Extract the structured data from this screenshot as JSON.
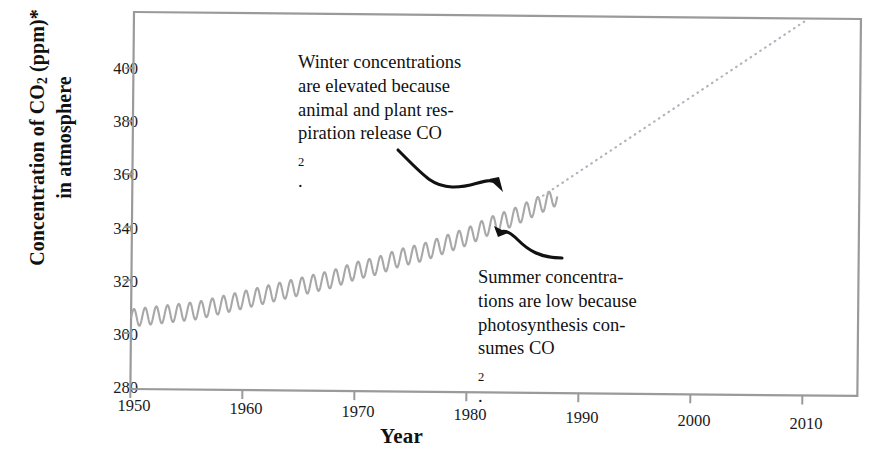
{
  "chart_data": {
    "type": "line",
    "title": "",
    "xlabel": "Year",
    "ylabel_line1": "Concentration of CO2 (ppm)*",
    "ylabel_line2": "in atmosphere",
    "ylabel_main": "Concentration of CO",
    "ylabel_sub": "2",
    "ylabel_tail": " (ppm)*",
    "xlim": [
      1950,
      2015
    ],
    "ylim": [
      280,
      418
    ],
    "grid": false,
    "legend": "none",
    "xticks": [
      "1950",
      "1960",
      "1970",
      "1980",
      "1990",
      "2000",
      "2010"
    ],
    "xtick_values": [
      1950,
      1960,
      1970,
      1980,
      1990,
      2000,
      2010
    ],
    "yticks": [
      "280",
      "300",
      "320",
      "340",
      "360",
      "380",
      "400"
    ],
    "ytick_values": [
      280,
      300,
      320,
      340,
      360,
      380,
      400
    ],
    "series": [
      {
        "name": "Observed CO2 (Keeling curve, seasonal oscillation)",
        "style": "solid-oscillating",
        "color": "#a8a8a8",
        "x_start": 1950,
        "x_end": 1988,
        "annual_cycle_amplitude_ppm": 3.2,
        "x": [
          1950,
          1952,
          1954,
          1956,
          1958,
          1960,
          1962,
          1964,
          1966,
          1968,
          1970,
          1972,
          1974,
          1976,
          1978,
          1980,
          1982,
          1984,
          1986,
          1988
        ],
        "values": [
          306,
          307,
          308,
          309,
          311,
          313,
          315,
          317,
          319,
          321,
          324,
          326,
          329,
          331,
          334,
          337,
          341,
          344,
          348,
          352
        ]
      },
      {
        "name": "Projected CO2",
        "style": "dotted-projection",
        "color": "#b4b4be",
        "x": [
          1988,
          1993,
          1998,
          2003,
          2008,
          2010
        ],
        "values": [
          352,
          366,
          381,
          396,
          411,
          417
        ]
      }
    ],
    "annotations": [
      {
        "id": "winter",
        "lines": [
          "Winter concentrations",
          "are elevated because",
          "animal and plant res-",
          "piration release CO2."
        ],
        "line4_main": "piration release CO",
        "line4_sub": "2",
        "line4_tail": ".",
        "points_to": "curve-peak",
        "arrow_direction": "down-right"
      },
      {
        "id": "summer",
        "lines": [
          "Summer concentra-",
          "tions are low because",
          "photosynthesis con-",
          "sumes CO2."
        ],
        "line4_main": "sumes CO",
        "line4_sub": "2",
        "line4_tail": ".",
        "points_to": "curve-trough",
        "arrow_direction": "up-left"
      }
    ],
    "colors": {
      "curve": "#a8a8a8",
      "projection": "#b4b4be",
      "frame": "#9a9a9a",
      "text": "#111111",
      "arrow": "#111111",
      "background": "#ffffff"
    }
  }
}
